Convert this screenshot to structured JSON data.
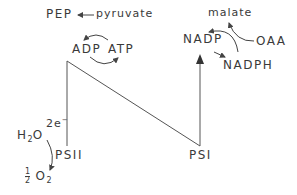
{
  "diagram": {
    "labels": {
      "pep": "PEP",
      "pyruvate": "pyruvate",
      "adp": "ADP",
      "atp": "ATP",
      "malate": "malate",
      "nadp": "NADP",
      "oaa": "OAA",
      "nadph": "NADPH",
      "electrons": "2e",
      "electrons_sup": "−",
      "h2o_h": "H",
      "h2o_sub": "2",
      "h2o_o": "O",
      "psii": "PSII",
      "psi": "PSI",
      "o2_num": "1",
      "o2_den": "2",
      "o2_o": "O",
      "o2_sub": "2"
    },
    "colors": {
      "line": "#555555",
      "text": "#3a3a3a",
      "background": "#ffffff"
    }
  }
}
